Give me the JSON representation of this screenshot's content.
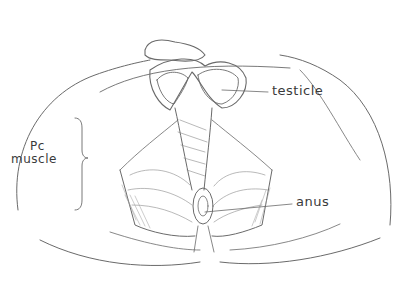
{
  "diagram": {
    "labels": {
      "pc_muscle_line1": "Pc",
      "pc_muscle_line2": "muscle",
      "testicle": "testicle",
      "anus": "anus"
    },
    "colors": {
      "stroke": "#5a5a5a",
      "shade": "#8a8a8a",
      "text": "#3a3a3a",
      "background": "#ffffff"
    }
  }
}
